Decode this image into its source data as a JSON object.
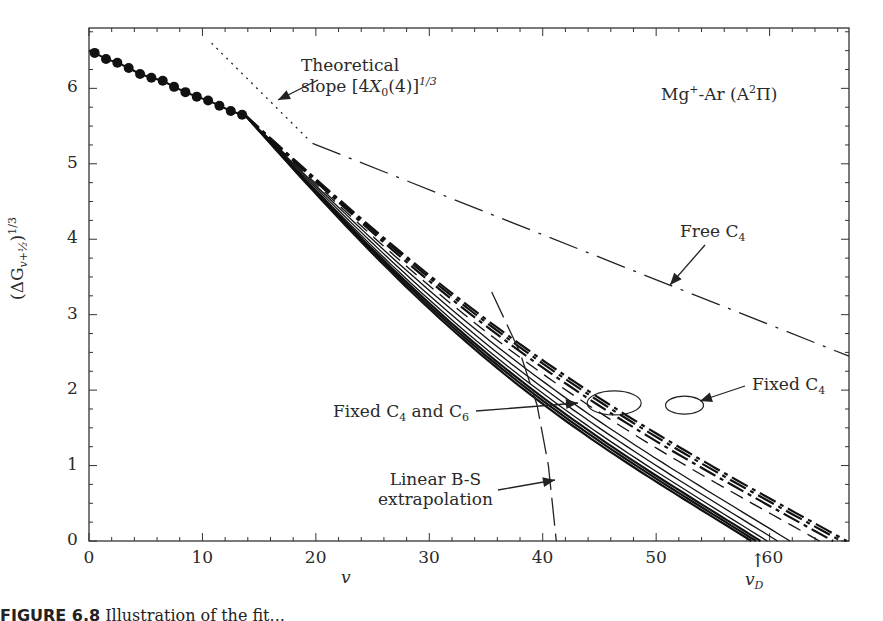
{
  "chart_data": {
    "type": "line",
    "xlabel": "v",
    "ylabel": "(ΔG_{v+½})^{1/3}",
    "xlim": [
      0,
      67
    ],
    "ylim": [
      0,
      6.8
    ],
    "xticks": [
      0,
      10,
      20,
      30,
      40,
      50,
      60
    ],
    "yticks": [
      0,
      1,
      2,
      3,
      4,
      5,
      6
    ],
    "grid": false,
    "annotations": [
      {
        "text": "Theoretical slope [4X0(4)]^1/3",
        "target": "theoretical-slope"
      },
      {
        "text": "Mg+-Ar (A2Π)",
        "target": "title"
      },
      {
        "text": "Free C4",
        "target": "free-c4"
      },
      {
        "text": "Fixed C4",
        "target": "fixed-c4"
      },
      {
        "text": "Fixed C4 and C6",
        "target": "fixed-c4-c6"
      },
      {
        "text": "Linear B-S extrapolation",
        "target": "linear-bs"
      },
      {
        "text": "vD",
        "target": "dissociation-marker",
        "x": 58.5
      }
    ],
    "series": [
      {
        "name": "Experimental data",
        "style": "markers+line",
        "x": [
          0.5,
          1.5,
          2.5,
          3.5,
          4.5,
          5.5,
          6.5,
          7.5,
          8.5,
          9.5,
          10.5,
          11.5,
          12.5,
          13.5
        ],
        "y": [
          6.47,
          6.39,
          6.34,
          6.27,
          6.19,
          6.14,
          6.1,
          6.02,
          5.95,
          5.89,
          5.84,
          5.77,
          5.7,
          5.65
        ]
      },
      {
        "name": "Theoretical slope",
        "style": "dotted",
        "x": [
          10.8,
          19.5
        ],
        "y": [
          6.6,
          5.3
        ]
      },
      {
        "name": "Free C4",
        "style": "dash-dot",
        "x": [
          19.7,
          67
        ],
        "y": [
          5.27,
          2.45
        ]
      },
      {
        "name": "Linear B-S extrapolation",
        "style": "long-dash",
        "x": [
          35.5,
          38.0,
          39.5,
          40.5,
          41.2
        ],
        "y": [
          3.3,
          2.5,
          1.8,
          1.0,
          0.0
        ]
      },
      {
        "name": "Fixed C4 and C6 (solid family)",
        "style": "solid",
        "endpoints_x_at_y0": [
          58.4,
          58.8,
          59.2,
          59.8,
          60.7,
          61.8
        ]
      },
      {
        "name": "Fixed C4 (dashed family)",
        "style": "dashed",
        "endpoints_x_at_y0": [
          64.4,
          65.6,
          66.3,
          66.8
        ]
      }
    ]
  },
  "labels": {
    "theoretical_line1": "Theoretical",
    "theoretical_line2_pre": "slope [4",
    "theoretical_X": "X",
    "theoretical_sub": "0",
    "theoretical_post": "(4)]",
    "theoretical_sup": "1/3",
    "title_pre": "Mg",
    "title_sup1": "+",
    "title_mid": "-Ar (A",
    "title_sup2": "2",
    "title_post": "Π)",
    "free_c4_pre": "Free C",
    "free_c4_sub": "4",
    "fixed_c4_pre": "Fixed C",
    "fixed_c4_sub": "4",
    "fixed_c4c6_pre": "Fixed C",
    "fixed_c4c6_sub1": "4",
    "fixed_c4c6_mid": " and C",
    "fixed_c4c6_sub2": "6",
    "linear_bs_line1": "Linear B-S",
    "linear_bs_line2": "extrapolation",
    "xlabel": "v",
    "vd_label": "v",
    "vd_sub": "D",
    "vd_arrow": "↑",
    "ylabel_pre": "(ΔG",
    "ylabel_sub": "v+½",
    "ylabel_post": ")",
    "ylabel_sup": "1/3",
    "caption_bold": "FIGURE 6.8",
    "caption_rest": "  Illustration of the fit..."
  },
  "ticks": {
    "x": [
      "0",
      "10",
      "20",
      "30",
      "40",
      "50",
      "60"
    ],
    "y": [
      "0",
      "1",
      "2",
      "3",
      "4",
      "5",
      "6"
    ]
  }
}
